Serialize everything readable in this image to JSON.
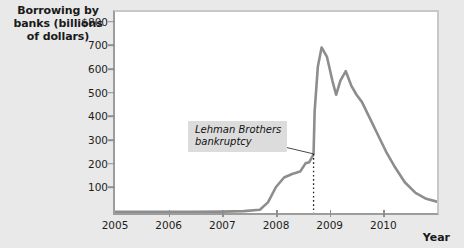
{
  "chart_data": {
    "type": "line",
    "title": "Borrowing by banks (billions of dollars)",
    "ylabel": "Borrowing by banks (billions of dollars)",
    "xlabel": "Year",
    "grid": false,
    "legend": null,
    "xlim": [
      2005,
      2011
    ],
    "ylim": [
      0,
      850
    ],
    "ytick_labels": [
      "$800",
      "700",
      "600",
      "500",
      "400",
      "300",
      "200",
      "100"
    ],
    "ytick_values": [
      800,
      700,
      600,
      500,
      400,
      300,
      200,
      100
    ],
    "xtick_labels": [
      "2005",
      "2006",
      "2007",
      "2008",
      "2009",
      "2010"
    ],
    "xtick_values": [
      2005,
      2006,
      2007,
      2008,
      2009,
      2010
    ],
    "series": [
      {
        "name": "Borrowing by banks",
        "color": "#8d8d8d",
        "x": [
          2005.0,
          2005.5,
          2006.0,
          2006.5,
          2007.0,
          2007.4,
          2007.7,
          2007.85,
          2008.0,
          2008.15,
          2008.3,
          2008.45,
          2008.55,
          2008.62,
          2008.68,
          2008.7,
          2008.72,
          2008.78,
          2008.85,
          2008.95,
          2009.05,
          2009.12,
          2009.2,
          2009.3,
          2009.4,
          2009.5,
          2009.6,
          2009.75,
          2009.9,
          2010.05,
          2010.2,
          2010.4,
          2010.6,
          2010.8,
          2011.0
        ],
        "y": [
          5,
          5,
          5,
          5,
          6,
          8,
          14,
          45,
          110,
          150,
          165,
          175,
          210,
          215,
          240,
          250,
          430,
          620,
          700,
          660,
          560,
          500,
          560,
          600,
          540,
          500,
          470,
          400,
          330,
          260,
          200,
          130,
          85,
          60,
          48
        ]
      }
    ],
    "annotations": [
      {
        "text": "Lehman Brothers\nbankruptcy",
        "x": 2008.7,
        "y": 250,
        "style": "italic",
        "box_color": "#dcdcdc",
        "marker": "dotted-vertical-line"
      }
    ]
  },
  "colors": {
    "background": "#e9e9e9",
    "plot_background": "#ffffff",
    "line": "#8d8d8d",
    "axis": "#9d9d9d",
    "text": "#1a1a1a"
  }
}
